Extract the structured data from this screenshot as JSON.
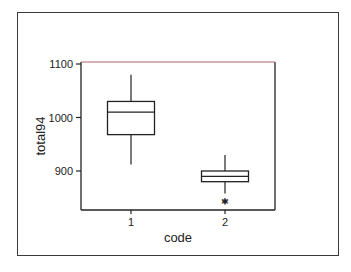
{
  "chart_data": {
    "type": "boxplot",
    "title": "",
    "xlabel": "code",
    "ylabel": "total94",
    "categories": [
      "1",
      "2"
    ],
    "y_ticks": [
      900,
      1000,
      1100
    ],
    "y_tick_labels": [
      "900",
      "1000",
      "1100"
    ],
    "ylim": [
      828,
      1104
    ],
    "grid": false,
    "legend": null,
    "boxes": [
      {
        "category": "1",
        "whisker_low": 912,
        "q1": 968,
        "median": 1010,
        "q3": 1030,
        "whisker_high": 1080,
        "outliers": []
      },
      {
        "category": "2",
        "whisker_low": 858,
        "q1": 880,
        "median": 890,
        "q3": 900,
        "whisker_high": 930,
        "outliers": [
          842,
          840
        ]
      }
    ],
    "outlier_symbol": "*",
    "colors": {
      "line": "#222222",
      "top_border": "#b06070",
      "frame": "#3a3a3a"
    }
  }
}
